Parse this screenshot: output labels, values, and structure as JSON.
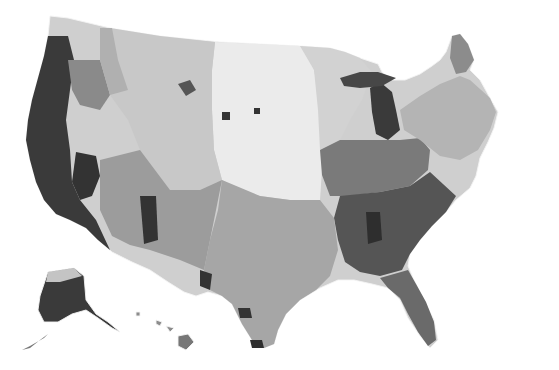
{
  "map": {
    "type": "choropleth",
    "subject": "United States counties",
    "color_scale": "grayscale (light = low, dark = high)",
    "palette": {
      "background": "#ffffff",
      "border": "#f4f4f4",
      "level_1": "#ebebeb",
      "level_2": "#d6d6d6",
      "level_3": "#bcbcbc",
      "level_4": "#9c9c9c",
      "level_5": "#777777",
      "level_6": "#4f4f4f",
      "level_7": "#2e2e2e"
    },
    "cut_off_title": "",
    "insets": [
      "Alaska",
      "Hawaii"
    ],
    "regions": [
      {
        "name": "Pacific coast (CA, OR, WA west)",
        "level": 7
      },
      {
        "name": "Nevada / Arizona",
        "level": 5
      },
      {
        "name": "Mountain West (ID, MT, WY, UT, CO)",
        "level": 3
      },
      {
        "name": "Great Plains (ND, SD, NE, KS)",
        "level": 1
      },
      {
        "name": "Texas / Oklahoma",
        "level": 3
      },
      {
        "name": "Upper Midwest (MN, WI, IA)",
        "level": 2
      },
      {
        "name": "Michigan",
        "level": 6
      },
      {
        "name": "Ohio Valley (IN, OH, KY, IL)",
        "level": 5
      },
      {
        "name": "Southeast (AL, GA, SC, NC, MS, TN)",
        "level": 6
      },
      {
        "name": "Florida",
        "level": 5
      },
      {
        "name": "Northeast (NY, PA, New England)",
        "level": 3
      },
      {
        "name": "Maine",
        "level": 4
      },
      {
        "name": "Alaska",
        "level": 6
      },
      {
        "name": "Hawaii",
        "level": 5
      }
    ]
  }
}
